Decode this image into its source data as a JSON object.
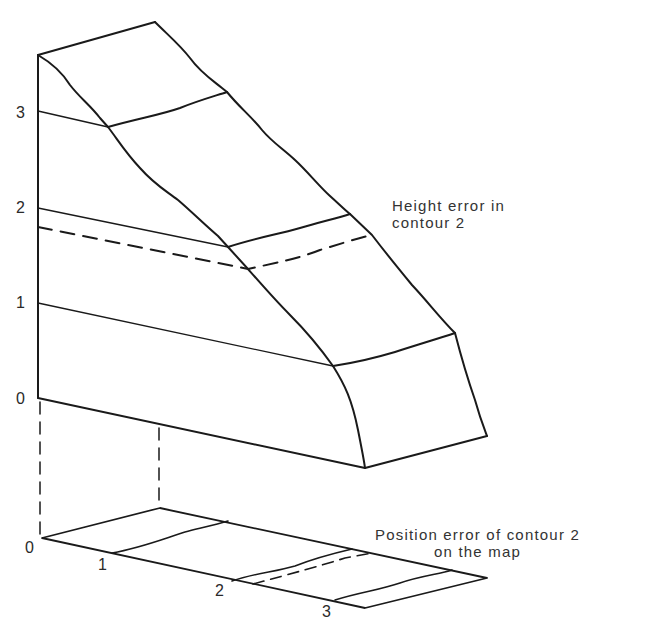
{
  "diagram": {
    "type": "3d-block-diagram",
    "vertical_axis": {
      "labels": [
        "0",
        "1",
        "2",
        "3"
      ]
    },
    "map_axis": {
      "labels": [
        "0",
        "1",
        "2",
        "3"
      ]
    },
    "annotations": {
      "height_error": {
        "line1": "Height error in",
        "line2": "contour 2"
      },
      "position_error": {
        "line1": "Position error of contour 2",
        "line2": "on the map"
      }
    },
    "colors": {
      "line": "#1a1a1a",
      "background": "#ffffff"
    }
  }
}
